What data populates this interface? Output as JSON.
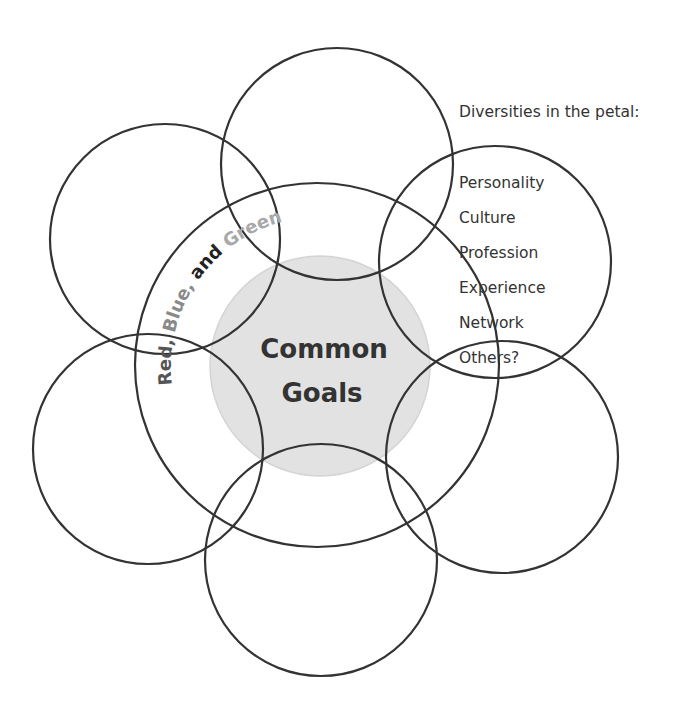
{
  "diagram": {
    "type": "flower-venn",
    "center": {
      "line1": "Common",
      "line2": "Goals",
      "fill": "#e2e2e2"
    },
    "ring_label": {
      "segments": [
        {
          "text": "Red, ",
          "color": "#555555"
        },
        {
          "text": "Blue, ",
          "color": "#8a8a8a"
        },
        {
          "text": "and ",
          "color": "#222222"
        },
        {
          "text": "Green",
          "color": "#a8a8a8"
        }
      ]
    },
    "petals": [
      {
        "position": "top",
        "cx": 337,
        "cy": 164,
        "r": 116
      },
      {
        "position": "upper-left",
        "cx": 165,
        "cy": 239,
        "r": 115
      },
      {
        "position": "lower-left",
        "cx": 148,
        "cy": 449,
        "r": 115
      },
      {
        "position": "bottom",
        "cx": 321,
        "cy": 560,
        "r": 116
      },
      {
        "position": "lower-right",
        "cx": 502,
        "cy": 457,
        "r": 116
      },
      {
        "position": "upper-right",
        "cx": 495,
        "cy": 262,
        "r": 116
      }
    ],
    "outer_circle": {
      "cx": 317,
      "cy": 365,
      "r": 182
    },
    "stroke_color": "#333333"
  },
  "diversities": {
    "title": "Diversities in the petal:",
    "items": [
      "Personality",
      "Culture",
      "Profession",
      "Experience",
      "Network",
      "Others?"
    ]
  }
}
